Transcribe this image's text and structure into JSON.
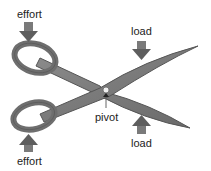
{
  "diagram": {
    "labels": {
      "effort_top": "effort",
      "effort_bottom": "effort",
      "load_top": "load",
      "load_bottom": "load",
      "pivot": "pivot"
    },
    "colors": {
      "blade_fill": "#7a7a7a",
      "blade_stroke": "#555555",
      "arrow_fill": "#6e6e6e",
      "text": "#222222",
      "pivot_dot": "#f0f0f0"
    }
  }
}
